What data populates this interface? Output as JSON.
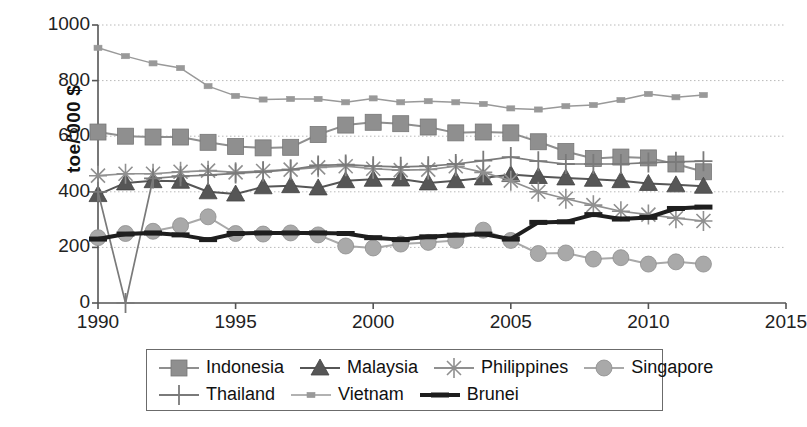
{
  "figure": {
    "background": "#ffffff",
    "plot_area": {
      "left": 98,
      "top": 25,
      "right": 786,
      "bottom": 303
    }
  },
  "axes": {
    "y_title": "toe/'000 $",
    "y_ticks": [
      "0",
      "200",
      "400",
      "600",
      "800",
      "1000"
    ],
    "x_ticks": [
      "1990",
      "1995",
      "2000",
      "2005",
      "2010",
      "2015"
    ]
  },
  "legend": {
    "rows": [
      [
        {
          "label": "Indonesia",
          "marker": "square",
          "color": "#8f8f8f",
          "line_width": 2
        },
        {
          "label": "Malaysia",
          "marker": "triangle",
          "color": "#565656",
          "line_width": 2
        },
        {
          "label": "Philippines",
          "marker": "asterisk",
          "color": "#909090",
          "line_width": 1.6
        },
        {
          "label": "Singapore",
          "marker": "circle",
          "color": "#a9a9a9",
          "line_width": 2
        }
      ],
      [
        {
          "label": "Thailand",
          "marker": "plus",
          "color": "#7a7a7a",
          "line_width": 1.6
        },
        {
          "label": "Vietnam",
          "marker": "small-square",
          "color": "#999999",
          "line_width": 1.4
        },
        {
          "label": "Brunei",
          "marker": "thick-bar",
          "color": "#1e1e1e",
          "line_width": 4
        }
      ]
    ]
  },
  "chart_data": {
    "type": "line",
    "title": "",
    "xlabel": "",
    "ylabel": "toe/'000 $",
    "xlim": [
      1990,
      2015
    ],
    "ylim": [
      0,
      1000
    ],
    "xticks": [
      1990,
      1995,
      2000,
      2005,
      2010,
      2015
    ],
    "yticks": [
      0,
      200,
      400,
      600,
      800,
      1000
    ],
    "grid": "horizontal-dotted",
    "legend_position": "below-plot",
    "x": [
      1990,
      1991,
      1992,
      1993,
      1994,
      1995,
      1996,
      1997,
      1998,
      1999,
      2000,
      2001,
      2002,
      2003,
      2004,
      2005,
      2006,
      2007,
      2008,
      2009,
      2010,
      2011,
      2012
    ],
    "series": [
      {
        "name": "Indonesia",
        "marker": "square",
        "color": "#8f8f8f",
        "values": [
          615,
          600,
          597,
          597,
          578,
          563,
          558,
          560,
          606,
          640,
          650,
          645,
          633,
          612,
          615,
          612,
          580,
          545,
          520,
          525,
          522,
          500,
          472
        ]
      },
      {
        "name": "Malaysia",
        "marker": "triangle",
        "color": "#565656",
        "values": [
          390,
          432,
          440,
          438,
          400,
          392,
          418,
          422,
          414,
          440,
          445,
          446,
          432,
          440,
          450,
          462,
          455,
          450,
          445,
          440,
          430,
          425,
          420
        ]
      },
      {
        "name": "Philippines",
        "marker": "asterisk",
        "color": "#909090",
        "values": [
          458,
          465,
          465,
          472,
          476,
          470,
          475,
          480,
          488,
          492,
          483,
          478,
          480,
          492,
          470,
          440,
          400,
          375,
          352,
          330,
          318,
          305,
          295
        ]
      },
      {
        "name": "Singapore",
        "marker": "circle",
        "color": "#a9a9a9",
        "values": [
          235,
          250,
          258,
          278,
          310,
          250,
          248,
          252,
          245,
          205,
          198,
          212,
          218,
          225,
          262,
          225,
          178,
          180,
          158,
          163,
          140,
          148,
          140
        ]
      },
      {
        "name": "Thailand",
        "marker": "plus",
        "color": "#7a7a7a",
        "values": [
          400,
          0,
          448,
          456,
          460,
          466,
          472,
          480,
          495,
          498,
          492,
          490,
          492,
          500,
          512,
          525,
          510,
          500,
          500,
          500,
          505,
          508,
          510
        ]
      },
      {
        "name": "Vietnam",
        "marker": "small-square",
        "color": "#999999",
        "values": [
          918,
          888,
          862,
          845,
          780,
          745,
          732,
          734,
          734,
          722,
          736,
          722,
          726,
          722,
          716,
          700,
          696,
          708,
          712,
          730,
          752,
          740,
          748
        ]
      },
      {
        "name": "Brunei",
        "marker": "thick-bar",
        "color": "#1e1e1e",
        "values": [
          230,
          248,
          252,
          245,
          228,
          250,
          252,
          252,
          252,
          250,
          235,
          228,
          238,
          244,
          248,
          230,
          290,
          292,
          318,
          302,
          308,
          340,
          345
        ]
      }
    ]
  }
}
